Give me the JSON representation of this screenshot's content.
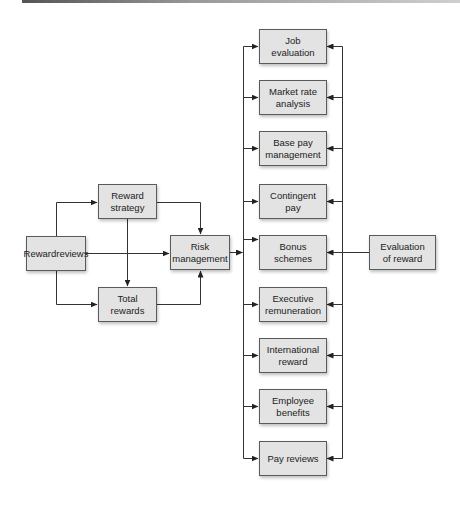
{
  "diagram": {
    "colors": {
      "node_fill": "#e3e3e3",
      "node_border": "#5a5a5a",
      "line": "#333333",
      "text": "#222222"
    },
    "nodes": {
      "reward_reviews": {
        "label": "Reward reviews",
        "lines": [
          "Reward",
          "reviews"
        ]
      },
      "reward_strategy": {
        "label": "Reward strategy",
        "lines": [
          "Reward",
          "strategy"
        ]
      },
      "total_rewards": {
        "label": "Total rewards",
        "lines": [
          "Total",
          "rewards"
        ]
      },
      "risk_management": {
        "label": "Risk management",
        "lines": [
          "Risk",
          "management"
        ]
      },
      "evaluation_of_reward": {
        "label": "Evaluation of reward",
        "lines": [
          "Evaluation",
          "of reward"
        ]
      }
    },
    "column": [
      {
        "label": "Job evaluation",
        "lines": [
          "Job",
          "evaluation"
        ]
      },
      {
        "label": "Market rate analysis",
        "lines": [
          "Market rate",
          "analysis"
        ]
      },
      {
        "label": "Base pay management",
        "lines": [
          "Base pay",
          "management"
        ]
      },
      {
        "label": "Contingent pay",
        "lines": [
          "Contingent",
          "pay"
        ]
      },
      {
        "label": "Bonus schemes",
        "lines": [
          "Bonus",
          "schemes"
        ]
      },
      {
        "label": "Executive remuneration",
        "lines": [
          "Executive",
          "remuneration"
        ]
      },
      {
        "label": "International reward",
        "lines": [
          "International",
          "reward"
        ]
      },
      {
        "label": "Employee benefits",
        "lines": [
          "Employee",
          "benefits"
        ]
      },
      {
        "label": "Pay reviews",
        "lines": [
          "Pay reviews"
        ]
      }
    ],
    "edges": [
      {
        "from": "Reward reviews",
        "to": "Reward strategy"
      },
      {
        "from": "Reward reviews",
        "to": "Total rewards"
      },
      {
        "from": "Reward reviews",
        "to": "Risk management"
      },
      {
        "from": "Reward strategy",
        "to": "Total rewards"
      },
      {
        "from": "Reward strategy",
        "to": "Risk management"
      },
      {
        "from": "Total rewards",
        "to": "Risk management"
      },
      {
        "from": "Risk management",
        "to": "all column items (left bus)"
      },
      {
        "from": "Evaluation of reward",
        "to": "all column items (right bus)"
      }
    ]
  }
}
